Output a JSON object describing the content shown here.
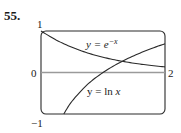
{
  "problem_number": "55.",
  "chart_data": {
    "type": "line",
    "title": "",
    "xlabel": "",
    "ylabel": "",
    "xlim": [
      0,
      2
    ],
    "ylim": [
      -1,
      1
    ],
    "grid": false,
    "legend": "none",
    "tick_labels": {
      "y_top": "1",
      "y_bottom": "−1",
      "x_left": "0",
      "x_right": "2"
    },
    "series": [
      {
        "name": "y = e^{-x}",
        "label_text": "y = e",
        "label_superscript": "−x",
        "x": [
          0,
          0.25,
          0.5,
          0.75,
          1.0,
          1.25,
          1.5,
          1.75,
          2.0
        ],
        "values": [
          1.0,
          0.779,
          0.607,
          0.472,
          0.368,
          0.287,
          0.223,
          0.174,
          0.135
        ]
      },
      {
        "name": "y = ln x",
        "label_text": "y = ln ",
        "label_var": "x",
        "x": [
          0.368,
          0.5,
          0.75,
          1.0,
          1.25,
          1.5,
          1.75,
          2.0
        ],
        "values": [
          -1.0,
          -0.693,
          -0.288,
          0.0,
          0.223,
          0.405,
          0.56,
          0.693
        ]
      }
    ],
    "annotations": [
      {
        "type": "horizontal_line",
        "y": 0,
        "color": "#9a9a9a"
      },
      {
        "type": "intersection",
        "x": 1.31,
        "y": 0.27
      }
    ]
  },
  "colors": {
    "curve": "#2a2a2a",
    "frame": "#2a2a2a",
    "axis_line": "#9a9a9a"
  }
}
